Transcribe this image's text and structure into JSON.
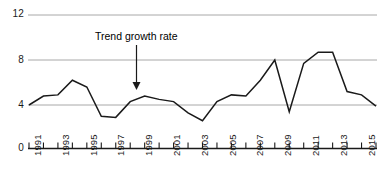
{
  "chart_data": {
    "type": "line",
    "title": "",
    "xlabel": "",
    "ylabel": "",
    "x": [
      1991,
      1992,
      1993,
      1994,
      1995,
      1996,
      1997,
      1998,
      1999,
      2000,
      2001,
      2002,
      2003,
      2004,
      2005,
      2006,
      2007,
      2008,
      2009,
      2010,
      2011,
      2012,
      2013,
      2014,
      2015
    ],
    "values": [
      4.0,
      4.8,
      4.9,
      6.2,
      5.6,
      3.0,
      2.9,
      4.3,
      4.8,
      4.5,
      4.3,
      3.3,
      2.6,
      4.3,
      4.9,
      4.8,
      6.2,
      8.0,
      3.4,
      7.7,
      8.7,
      8.7,
      5.2,
      4.9,
      3.9
    ],
    "series": [
      {
        "name": "growth rate",
        "values": [
          4.0,
          4.8,
          4.9,
          6.2,
          5.6,
          3.0,
          2.9,
          4.3,
          4.8,
          4.5,
          4.3,
          3.3,
          2.6,
          4.3,
          4.9,
          4.8,
          6.2,
          8.0,
          3.4,
          7.7,
          8.7,
          8.7,
          5.2,
          4.9,
          3.9
        ],
        "color": "#1a1a1a"
      }
    ],
    "ylim": [
      0,
      12
    ],
    "yticks": [
      0,
      4,
      8,
      12
    ],
    "ytick_labels": [
      "0",
      "4",
      "8",
      "12"
    ],
    "xlim": [
      1991,
      2015
    ],
    "xticks": [
      1991,
      1992,
      1993,
      1994,
      1995,
      1996,
      1997,
      1998,
      1999,
      2000,
      2001,
      2002,
      2003,
      2004,
      2005,
      2006,
      2007,
      2008,
      2009,
      2010,
      2011,
      2012,
      2013,
      2014,
      2015
    ],
    "xtick_labels": [
      "1991",
      "",
      "1993",
      "",
      "1995",
      "",
      "1997",
      "",
      "1999",
      "",
      "2001",
      "",
      "2003",
      "",
      "2005",
      "",
      "2007",
      "",
      "2009",
      "",
      "2011",
      "",
      "2013",
      "",
      "2015"
    ],
    "xtick_labels_shown": [
      "1991",
      "1993",
      "1995",
      "1997",
      "1999",
      "2001",
      "2003",
      "2005",
      "2007",
      "2009",
      "2011",
      "2013",
      "2015"
    ],
    "grid": true,
    "gridlines_at": [
      4,
      8,
      12
    ],
    "grid_color": "#a8a8a8",
    "axis_color": "#1a1a1a",
    "legend": "none",
    "annotations": [
      {
        "text": "Trend growth rate",
        "points_to_year": 1998,
        "points_to_value": 4.3,
        "arrow": "down-arrow"
      }
    ]
  },
  "axes": {
    "y_labels": [
      "12",
      "8",
      "4",
      "0"
    ],
    "x_labels": [
      "1991",
      "1993",
      "1995",
      "1997",
      "1999",
      "2001",
      "2003",
      "2005",
      "2007",
      "2009",
      "2011",
      "2013",
      "2015"
    ]
  },
  "annotation": {
    "label": "Trend growth rate"
  }
}
